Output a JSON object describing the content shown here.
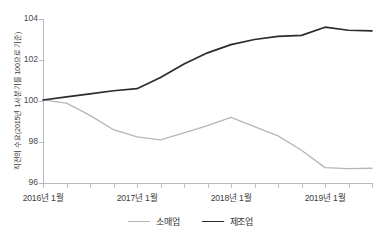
{
  "chart_data": {
    "type": "line",
    "title": "",
    "xlabel": "",
    "ylabel": "직전의 수요(2015년 1사분기를 100으로 기준)",
    "ylim": [
      96,
      104
    ],
    "yticks": [
      96,
      98,
      100,
      102,
      104
    ],
    "ytick_labels": [
      "96",
      "98",
      "100",
      "102",
      "104"
    ],
    "xlim": [
      0,
      14
    ],
    "xtick_labels": [
      "2016년 1월",
      "2017년 1월",
      "2018년 1월",
      "2019년 1월"
    ],
    "xtick_positions": [
      0,
      4,
      8,
      12
    ],
    "grid": false,
    "legend_position": "bottom",
    "x": [
      0,
      1,
      2,
      3,
      4,
      5,
      6,
      7,
      8,
      9,
      10,
      11,
      12,
      13,
      14
    ],
    "series": [
      {
        "name": "소매업",
        "color": "#b6b6b6",
        "values": [
          100.05,
          99.9,
          99.3,
          98.6,
          98.25,
          98.1,
          98.45,
          98.8,
          99.2,
          98.75,
          98.3,
          97.6,
          96.75,
          96.7,
          96.72
        ]
      },
      {
        "name": "제조업",
        "color": "#2b2b2b",
        "values": [
          100.05,
          100.2,
          100.35,
          100.5,
          100.6,
          101.15,
          101.8,
          102.35,
          102.75,
          103.0,
          103.15,
          103.2,
          103.6,
          103.45,
          103.42
        ]
      }
    ]
  },
  "legend": {
    "items": [
      {
        "label": "소매업",
        "color": "#b6b6b6"
      },
      {
        "label": "제조업",
        "color": "#2b2b2b"
      }
    ]
  },
  "axes": {
    "y_title": "직전의 수요(2015년 1사분기를 100으로 기준)",
    "y_labels": [
      "104",
      "102",
      "100",
      "98",
      "96"
    ],
    "x_labels": [
      "2016년 1월",
      "2017년 1월",
      "2018년 1월",
      "2019년 1월"
    ]
  },
  "colors": {
    "retail_line": "#b6b6b6",
    "manufacturing_line": "#2b2b2b",
    "axis": "#b9b9b9",
    "text": "#3d3d3d",
    "background": "#ffffff"
  }
}
